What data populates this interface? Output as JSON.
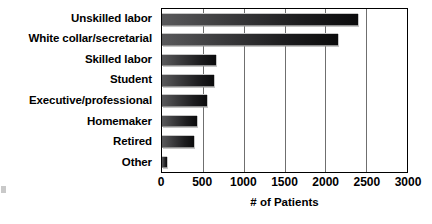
{
  "chart_data": {
    "type": "bar",
    "orientation": "horizontal",
    "title": "",
    "xlabel": "# of Patients",
    "ylabel": "",
    "categories": [
      "Unskilled labor",
      "White collar/secretarial",
      "Skilled labor",
      "Student",
      "Executive/professional",
      "Homemaker",
      "Retired",
      "Other"
    ],
    "values": [
      2400,
      2150,
      660,
      635,
      550,
      430,
      390,
      65
    ],
    "xlim": [
      0,
      3000
    ],
    "xticks": [
      0,
      500,
      1000,
      1500,
      2000,
      2500,
      3000
    ],
    "xtick_labels": [
      "0",
      "500",
      "1000",
      "1500",
      "2000",
      "2500",
      "3000"
    ],
    "grid": true,
    "grid_axis": "x",
    "legend": false,
    "bar_color_start": "#59595b",
    "bar_color_end": "#0b0b0c",
    "plot_border_color": "#000000",
    "gridline_color": "#6f6f6f",
    "background_color": "#ffffff"
  }
}
